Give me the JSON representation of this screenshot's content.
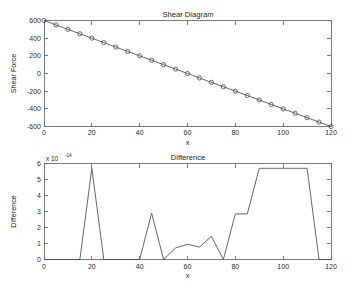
{
  "figure": {
    "background": "#ffffff",
    "line_color": "#4a4a4a",
    "axis_color": "#6b6b6b"
  },
  "chart_data": [
    {
      "type": "line",
      "title": "Shear Diagram",
      "xlabel": "x",
      "ylabel": "Shear Force",
      "xlim": [
        0,
        120
      ],
      "ylim": [
        -600,
        600
      ],
      "xticks": [
        0,
        20,
        40,
        60,
        80,
        100,
        120
      ],
      "xticklabels": [
        "0",
        "20",
        "40",
        "60",
        "80",
        "100",
        "120"
      ],
      "yticks": [
        -600,
        -400,
        -200,
        0,
        200,
        400,
        600
      ],
      "yticklabels": [
        "-600",
        "-400",
        "-200",
        "0",
        "200",
        "400",
        "600"
      ],
      "grid": false,
      "legend": "none",
      "marker": "circle",
      "x": [
        0,
        5,
        10,
        15,
        20,
        25,
        30,
        35,
        40,
        45,
        50,
        55,
        60,
        65,
        70,
        75,
        80,
        85,
        90,
        95,
        100,
        105,
        110,
        115,
        120
      ],
      "values": [
        600,
        550,
        500,
        450,
        400,
        350,
        300,
        250,
        200,
        150,
        100,
        50,
        0,
        -50,
        -100,
        -150,
        -200,
        -250,
        -300,
        -350,
        -400,
        -450,
        -500,
        -550,
        -600
      ]
    },
    {
      "type": "line",
      "title": "Difference",
      "xlabel": "x",
      "ylabel": "Difference",
      "y_exponent_label": "x 10",
      "y_exponent_power": "-14",
      "xlim": [
        0,
        120
      ],
      "ylim": [
        0,
        6
      ],
      "xticks": [
        0,
        20,
        40,
        60,
        80,
        100,
        120
      ],
      "xticklabels": [
        "0",
        "20",
        "40",
        "60",
        "80",
        "100",
        "120"
      ],
      "yticks": [
        0,
        1,
        2,
        3,
        4,
        5,
        6
      ],
      "yticklabels": [
        "0",
        "1",
        "2",
        "3",
        "4",
        "5",
        "6"
      ],
      "grid": false,
      "legend": "none",
      "marker": "none",
      "x": [
        0,
        5,
        10,
        15,
        20,
        25,
        30,
        35,
        40,
        45,
        50,
        55,
        60,
        65,
        70,
        75,
        80,
        85,
        90,
        95,
        100,
        105,
        110,
        115,
        120
      ],
      "values": [
        0,
        0,
        0,
        0,
        5.7,
        0,
        0,
        0,
        0,
        2.9,
        0,
        0.72,
        0.95,
        0.78,
        1.45,
        0,
        2.85,
        2.85,
        5.7,
        5.7,
        5.7,
        5.7,
        5.7,
        0,
        0
      ]
    }
  ]
}
